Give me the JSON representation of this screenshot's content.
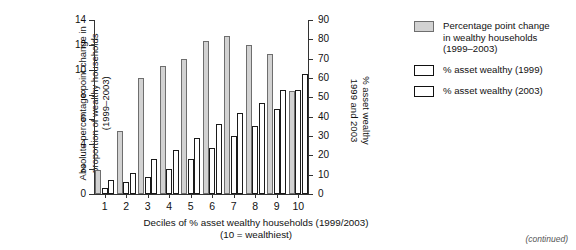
{
  "chart_data": {
    "type": "bar",
    "title": "",
    "categories": [
      "1",
      "2",
      "3",
      "4",
      "5",
      "6",
      "7",
      "8",
      "9",
      "10"
    ],
    "xlabel": "Deciles of % asset wealthy households (1999/2003)\n(10 = wealthiest)",
    "ylabel": "Absolute percentage point change in\nproportion of wealthy households\n(1999–2003)",
    "y2label": "% asset wealthy\n1999 and 2003",
    "ylim": [
      0,
      14
    ],
    "y2lim": [
      0,
      90
    ],
    "yticks": [
      0,
      2,
      4,
      6,
      8,
      10,
      12,
      14
    ],
    "y2ticks": [
      0,
      10,
      20,
      30,
      40,
      50,
      60,
      70,
      80,
      90
    ],
    "grid": false,
    "legend_position": "right",
    "series": [
      {
        "name": "Percentage point change\nin wealthy households\n(1999–2003)",
        "axis": "left",
        "style": "filled-gray",
        "values": [
          1.9,
          5.1,
          9.3,
          10.3,
          10.9,
          12.3,
          12.7,
          12.0,
          11.3,
          8.3
        ]
      },
      {
        "name": "% asset wealthy (1999)",
        "axis": "right",
        "style": "open",
        "values": [
          3,
          6,
          9,
          13,
          18,
          24,
          30,
          35,
          44,
          54
        ]
      },
      {
        "name": "% asset wealthy (2003)",
        "axis": "right",
        "style": "open",
        "values": [
          7,
          11,
          18,
          23,
          29,
          36,
          42,
          47,
          54,
          62
        ]
      }
    ]
  },
  "axes": {
    "left_title": "Absolute percentage point change in\nproportion of wealthy households\n(1999–2003)",
    "right_title": "% asset wealthy\n1999 and 2003",
    "x_title": "Deciles of % asset wealthy households (1999/2003)\n(10 = wealthiest)"
  },
  "legend": {
    "items": [
      {
        "swatch": "filled-gray",
        "label": "Percentage point change\nin wealthy households\n(1999–2003)"
      },
      {
        "swatch": "open",
        "label": "% asset wealthy (1999)"
      },
      {
        "swatch": "open",
        "label": "% asset wealthy (2003)"
      }
    ]
  },
  "footer": {
    "continued": "(continued)"
  },
  "colors": {
    "change_fill": "#d2d2d2",
    "change_border": "#6e6e6e",
    "open_border": "#1a1a1a",
    "axis": "#333333",
    "text": "#111111"
  }
}
